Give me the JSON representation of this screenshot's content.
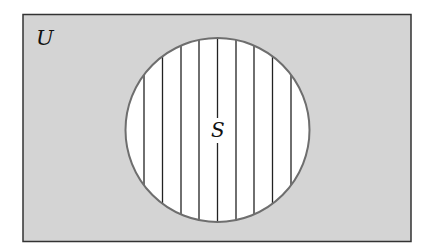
{
  "diagram": {
    "type": "venn",
    "universe": {
      "label": "U",
      "fill": "#d4d4d4",
      "stroke": "#333333"
    },
    "set": {
      "label": "S",
      "fill": "#ffffff",
      "stroke": "#6e6e6e",
      "hatch": "vertical-lines",
      "hatch_color": "#222222"
    }
  }
}
